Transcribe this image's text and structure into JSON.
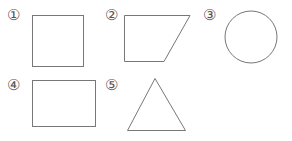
{
  "shapes": [
    {
      "number": "①",
      "kind": "square"
    },
    {
      "number": "②",
      "kind": "trapezoid"
    },
    {
      "number": "③",
      "kind": "circle"
    },
    {
      "number": "④",
      "kind": "rectangle"
    },
    {
      "number": "⑤",
      "kind": "triangle"
    }
  ],
  "colors": {
    "stroke": "#777777",
    "label": "#555555"
  }
}
